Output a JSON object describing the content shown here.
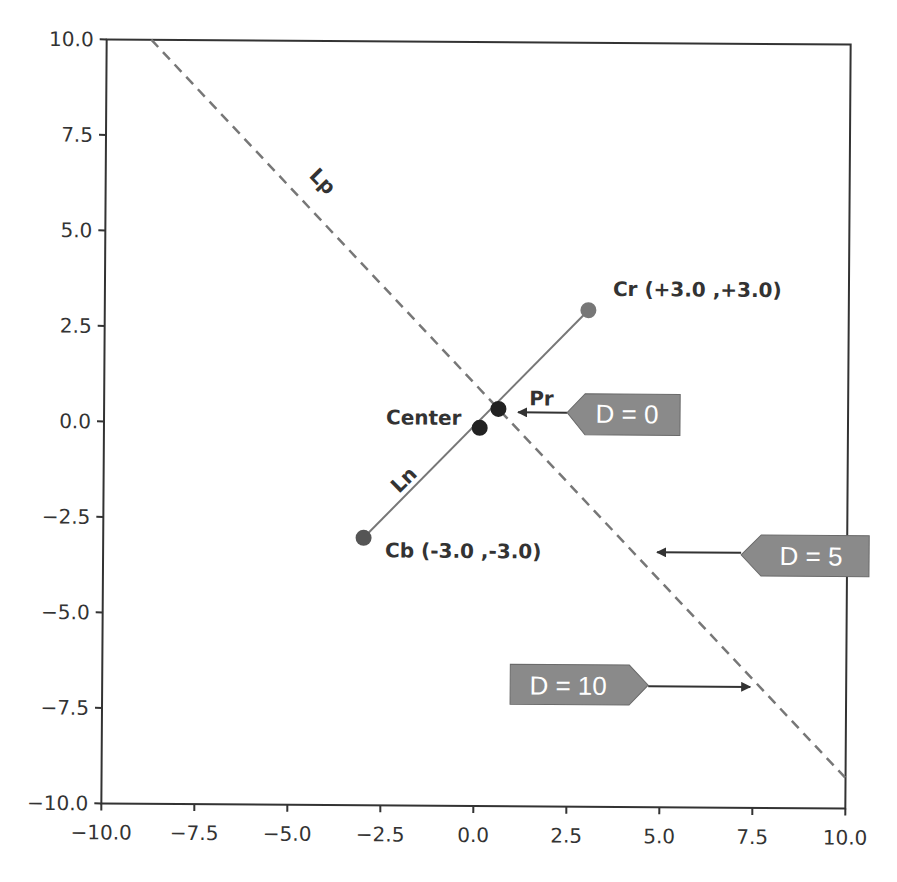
{
  "chart_data": {
    "type": "line",
    "title": "",
    "xlabel": "",
    "ylabel": "",
    "xlim": [
      -10.0,
      10.0
    ],
    "ylim": [
      -10.0,
      10.0
    ],
    "grid": false,
    "legend": null,
    "xticks": [
      "−10.0",
      "−7.5",
      "−5.0",
      "−2.5",
      "0.0",
      "2.5",
      "5.0",
      "7.5",
      "10.0"
    ],
    "yticks": [
      "10.0",
      "7.5",
      "5.0",
      "2.5",
      "0.0",
      "−2.5",
      "−5.0",
      "−7.5",
      "−10.0"
    ],
    "xtick_values": [
      -10,
      -7.5,
      -5,
      -2.5,
      0,
      2.5,
      5,
      7.5,
      10
    ],
    "ytick_values": [
      10,
      7.5,
      5,
      2.5,
      0,
      -2.5,
      -5,
      -7.5,
      -10
    ],
    "series": [
      {
        "name": "Lp",
        "style": "dashed",
        "color": "#777777",
        "x": [
          -8.8,
          10.0
        ],
        "y": [
          10.0,
          -9.2
        ]
      },
      {
        "name": "Ln",
        "style": "solid",
        "color": "#777777",
        "x": [
          -3.0,
          3.0
        ],
        "y": [
          -3.0,
          3.0
        ]
      }
    ],
    "points": [
      {
        "name": "Cr",
        "label": "Cr (+3.0 ,+3.0)",
        "x": 3.0,
        "y": 3.0,
        "color": "#777777"
      },
      {
        "name": "Cb",
        "label": "Cb (-3.0 ,-3.0)",
        "x": -3.0,
        "y": -3.0,
        "color": "#555555"
      },
      {
        "name": "Center",
        "label": "Center",
        "x": 0.1,
        "y": -0.1,
        "color": "#222222"
      },
      {
        "name": "Pr",
        "label": "Pr",
        "x": 0.6,
        "y": 0.4,
        "color": "#222222"
      }
    ],
    "line_labels": [
      {
        "text": "Lp",
        "x": -4.3,
        "y": 6.2,
        "rotation": 45
      },
      {
        "text": "Ln",
        "x": -1.8,
        "y": -1.6,
        "rotation": -45
      }
    ],
    "annotations": [
      {
        "text": "D = 0",
        "arrow_to": [
          1.1,
          0.3
        ],
        "box_side": "right"
      },
      {
        "text": "D = 5",
        "arrow_to": [
          4.9,
          -3.3
        ],
        "box_side": "right"
      },
      {
        "text": "D = 10",
        "arrow_to": [
          7.5,
          -6.7
        ],
        "box_side": "left"
      }
    ],
    "tag_color": "#8a8a8a",
    "axis_color": "#333333"
  }
}
